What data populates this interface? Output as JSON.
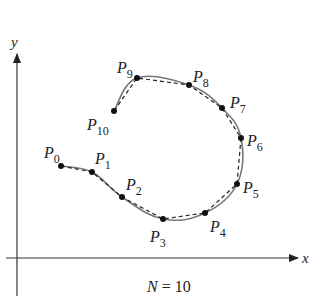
{
  "figure": {
    "caption": "N = 10",
    "caption_n": "N",
    "caption_eq": " = 10",
    "axes": {
      "x_label": "x",
      "y_label": "y"
    },
    "curve_color": "#777777",
    "polyline_color": "#222222",
    "points": [
      {
        "name": "P",
        "sub": "0",
        "x": 61,
        "y": 166,
        "lx": 44,
        "ly": 158
      },
      {
        "name": "P",
        "sub": "1",
        "x": 92,
        "y": 172,
        "lx": 95,
        "ly": 164
      },
      {
        "name": "P",
        "sub": "2",
        "x": 122,
        "y": 197,
        "lx": 126,
        "ly": 190
      },
      {
        "name": "P",
        "sub": "3",
        "x": 163,
        "y": 219,
        "lx": 150,
        "ly": 242
      },
      {
        "name": "P",
        "sub": "4",
        "x": 205,
        "y": 213,
        "lx": 210,
        "ly": 232
      },
      {
        "name": "P",
        "sub": "5",
        "x": 237,
        "y": 184,
        "lx": 243,
        "ly": 193
      },
      {
        "name": "P",
        "sub": "6",
        "x": 241,
        "y": 138,
        "lx": 247,
        "ly": 146
      },
      {
        "name": "P",
        "sub": "7",
        "x": 222,
        "y": 108,
        "lx": 230,
        "ly": 108
      },
      {
        "name": "P",
        "sub": "8",
        "x": 189,
        "y": 85,
        "lx": 193,
        "ly": 82
      },
      {
        "name": "P",
        "sub": "9",
        "x": 137,
        "y": 78,
        "lx": 117,
        "ly": 73
      },
      {
        "name": "P",
        "sub": "10",
        "x": 114,
        "y": 111,
        "lx": 87,
        "ly": 130
      }
    ]
  }
}
